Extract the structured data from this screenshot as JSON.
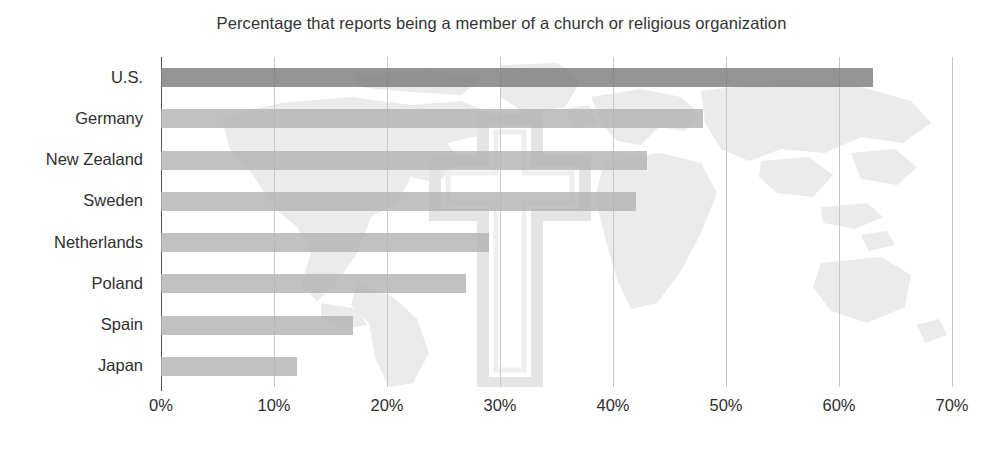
{
  "chart_data": {
    "type": "bar",
    "orientation": "horizontal",
    "title": "Percentage that reports being a member of a church or religious organization",
    "xlabel": "",
    "ylabel": "",
    "categories": [
      "U.S.",
      "Germany",
      "New Zealand",
      "Sweden",
      "Netherlands",
      "Poland",
      "Spain",
      "Japan"
    ],
    "values": [
      63,
      48,
      43,
      42,
      29,
      27,
      17,
      12
    ],
    "xlim": [
      0,
      70
    ],
    "xticks": [
      0,
      10,
      20,
      30,
      40,
      50,
      60,
      70
    ],
    "xtick_labels": [
      "0%",
      "10%",
      "20%",
      "30%",
      "40%",
      "50%",
      "60%",
      "70%"
    ],
    "grid": true,
    "legend": false,
    "bar_colors": [
      "#7d7d7d",
      "#b3b3b3",
      "#b3b3b3",
      "#b3b3b3",
      "#b3b3b3",
      "#b3b3b3",
      "#b3b3b3",
      "#b3b3b3"
    ],
    "highlight_category": "U.S.",
    "background_watermark": [
      "world-map",
      "christian-cross"
    ]
  },
  "colors": {
    "highlight_bar": "#7d7d7d",
    "standard_bar": "#b3b3b3",
    "gridline": "#c8c8c8",
    "axis": "#555555",
    "watermark": "#e9e9e9",
    "text": "#2e2e2e",
    "background": "#ffffff"
  }
}
